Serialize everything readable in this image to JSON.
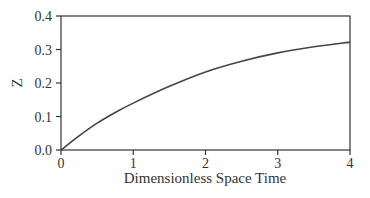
{
  "chart_data": {
    "type": "line",
    "title": "",
    "xlabel": "Dimensionless Space Time",
    "ylabel": "Z",
    "xlim": [
      0,
      4
    ],
    "ylim": [
      0,
      0.4
    ],
    "xticks": [
      "0",
      "1",
      "2",
      "3",
      "4"
    ],
    "yticks": [
      "0.0",
      "0.1",
      "0.2",
      "0.3",
      "0.4"
    ],
    "grid": false,
    "legend": null,
    "series": [
      {
        "name": "Z",
        "x": [
          0,
          0.25,
          0.5,
          0.75,
          1.0,
          1.5,
          2.0,
          2.5,
          3.0,
          3.5,
          4.0
        ],
        "values": [
          0,
          0.042,
          0.08,
          0.112,
          0.14,
          0.19,
          0.233,
          0.265,
          0.29,
          0.308,
          0.322
        ]
      }
    ]
  }
}
